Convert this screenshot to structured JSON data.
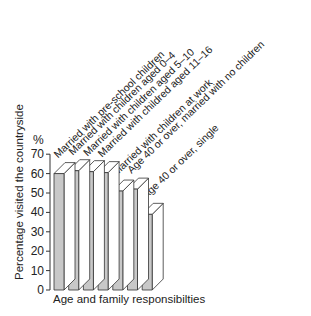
{
  "chart_data": {
    "type": "bar",
    "title": "",
    "ylabel": "Percentage visited the countryside",
    "yunit": "%",
    "xlabel": "Age and family responsibilties",
    "ylim": [
      0,
      70
    ],
    "yticks": [
      "0",
      "10",
      "20",
      "30",
      "40",
      "50",
      "60",
      "70"
    ],
    "grid": false,
    "style": "3d-bars",
    "colors": {
      "front": "#c8c8c8",
      "side": "#ffffff",
      "stroke": "#333333"
    },
    "categories": [
      "Married with pre-school children",
      "Married with children aged 0–4",
      "Married with children aged 5–10",
      "Married with childred aged 11–16",
      "Married with children at work",
      "Age 40 or over, married with no children",
      "Age 40 or over, single"
    ],
    "values": [
      60,
      61.5,
      61,
      60.5,
      51,
      52,
      39
    ]
  }
}
